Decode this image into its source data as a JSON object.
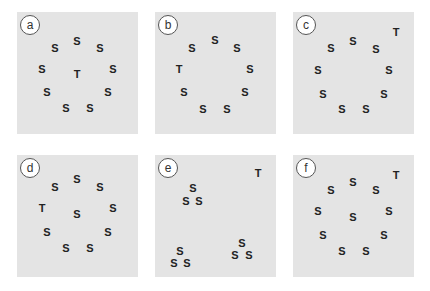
{
  "panels": [
    {
      "label": "a",
      "position": {
        "left": 17,
        "top": 12
      },
      "items": [
        {
          "char": "S",
          "x": 60,
          "y": 29
        },
        {
          "char": "S",
          "x": 38,
          "y": 36
        },
        {
          "char": "S",
          "x": 83,
          "y": 36
        },
        {
          "char": "S",
          "x": 25,
          "y": 57
        },
        {
          "char": "T",
          "x": 60,
          "y": 62
        },
        {
          "char": "S",
          "x": 96,
          "y": 57
        },
        {
          "char": "S",
          "x": 30,
          "y": 80
        },
        {
          "char": "S",
          "x": 91,
          "y": 80
        },
        {
          "char": "S",
          "x": 49,
          "y": 96
        },
        {
          "char": "S",
          "x": 73,
          "y": 96
        }
      ]
    },
    {
      "label": "b",
      "position": {
        "left": 155,
        "top": 12
      },
      "items": [
        {
          "char": "S",
          "x": 60,
          "y": 28
        },
        {
          "char": "S",
          "x": 37,
          "y": 36
        },
        {
          "char": "S",
          "x": 82,
          "y": 36
        },
        {
          "char": "T",
          "x": 24,
          "y": 57
        },
        {
          "char": "S",
          "x": 95,
          "y": 57
        },
        {
          "char": "S",
          "x": 29,
          "y": 80
        },
        {
          "char": "S",
          "x": 90,
          "y": 80
        },
        {
          "char": "S",
          "x": 48,
          "y": 97
        },
        {
          "char": "S",
          "x": 72,
          "y": 97
        }
      ]
    },
    {
      "label": "c",
      "position": {
        "left": 293,
        "top": 12
      },
      "items": [
        {
          "char": "T",
          "x": 103,
          "y": 20
        },
        {
          "char": "S",
          "x": 60,
          "y": 29
        },
        {
          "char": "S",
          "x": 38,
          "y": 36
        },
        {
          "char": "S",
          "x": 83,
          "y": 37
        },
        {
          "char": "S",
          "x": 25,
          "y": 58
        },
        {
          "char": "S",
          "x": 96,
          "y": 58
        },
        {
          "char": "S",
          "x": 30,
          "y": 82
        },
        {
          "char": "S",
          "x": 91,
          "y": 82
        },
        {
          "char": "S",
          "x": 49,
          "y": 97
        },
        {
          "char": "S",
          "x": 73,
          "y": 97
        }
      ]
    },
    {
      "label": "d",
      "position": {
        "left": 17,
        "top": 155
      },
      "items": [
        {
          "char": "S",
          "x": 60,
          "y": 24
        },
        {
          "char": "S",
          "x": 38,
          "y": 32
        },
        {
          "char": "S",
          "x": 83,
          "y": 32
        },
        {
          "char": "T",
          "x": 25,
          "y": 53
        },
        {
          "char": "S",
          "x": 60,
          "y": 59
        },
        {
          "char": "S",
          "x": 96,
          "y": 53
        },
        {
          "char": "S",
          "x": 30,
          "y": 77
        },
        {
          "char": "S",
          "x": 91,
          "y": 77
        },
        {
          "char": "S",
          "x": 49,
          "y": 93
        },
        {
          "char": "S",
          "x": 73,
          "y": 93
        }
      ]
    },
    {
      "label": "e",
      "position": {
        "left": 155,
        "top": 155
      },
      "items": [
        {
          "char": "T",
          "x": 103,
          "y": 18
        },
        {
          "char": "S",
          "x": 38,
          "y": 33
        },
        {
          "char": "S",
          "x": 31,
          "y": 46
        },
        {
          "char": "S",
          "x": 44,
          "y": 46
        },
        {
          "char": "S",
          "x": 25,
          "y": 96
        },
        {
          "char": "S",
          "x": 19,
          "y": 108
        },
        {
          "char": "S",
          "x": 32,
          "y": 108
        },
        {
          "char": "S",
          "x": 87,
          "y": 88
        },
        {
          "char": "S",
          "x": 80,
          "y": 100
        },
        {
          "char": "S",
          "x": 94,
          "y": 100
        }
      ]
    },
    {
      "label": "f",
      "position": {
        "left": 293,
        "top": 155
      },
      "items": [
        {
          "char": "T",
          "x": 103,
          "y": 20
        },
        {
          "char": "S",
          "x": 60,
          "y": 27
        },
        {
          "char": "S",
          "x": 38,
          "y": 35
        },
        {
          "char": "S",
          "x": 83,
          "y": 35
        },
        {
          "char": "S",
          "x": 25,
          "y": 56
        },
        {
          "char": "S",
          "x": 60,
          "y": 62
        },
        {
          "char": "S",
          "x": 96,
          "y": 56
        },
        {
          "char": "S",
          "x": 30,
          "y": 80
        },
        {
          "char": "S",
          "x": 91,
          "y": 80
        },
        {
          "char": "S",
          "x": 49,
          "y": 96
        },
        {
          "char": "S",
          "x": 73,
          "y": 96
        }
      ]
    }
  ]
}
